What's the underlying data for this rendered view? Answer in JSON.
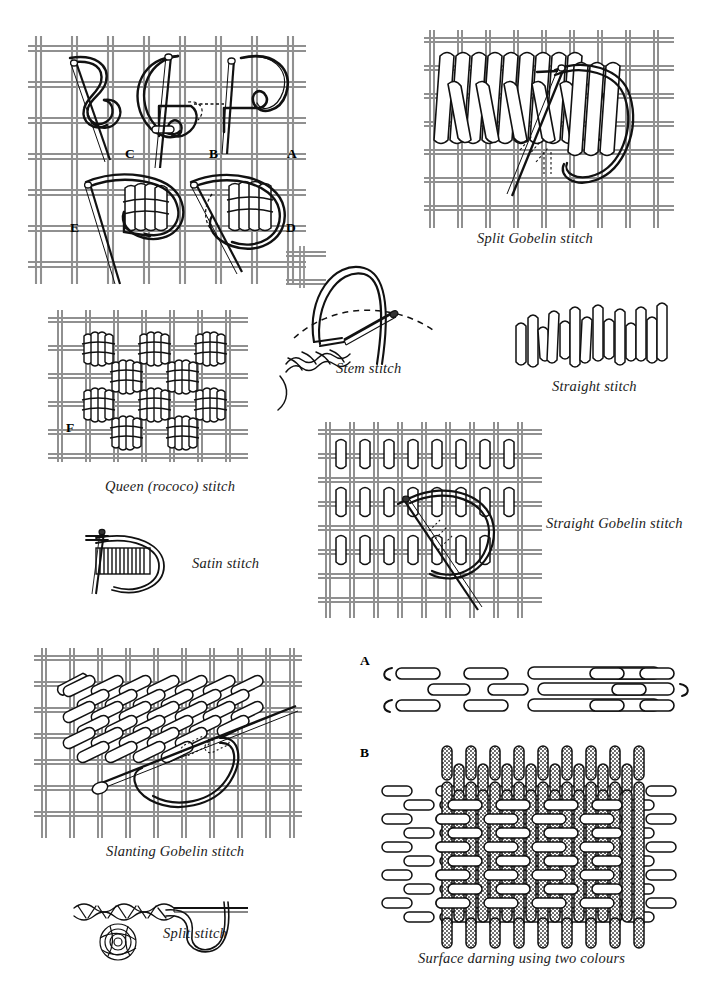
{
  "page": {
    "kind": "embroidery-stitch-diagram-plate",
    "background": "#ffffff",
    "ink": "#1a1a1a",
    "canvas_thread_color": "#8f8f8f",
    "second_colour_fill": "#b9b9b9"
  },
  "figures": [
    {
      "id": "rococo-steps",
      "caption": "",
      "step_labels": [
        "A",
        "B",
        "C",
        "D",
        "E"
      ]
    },
    {
      "id": "split-gobelin",
      "caption": "Split Gobelin stitch"
    },
    {
      "id": "stem",
      "caption": "Stem stitch"
    },
    {
      "id": "straight",
      "caption": "Straight stitch"
    },
    {
      "id": "queen-rococo",
      "caption": "Queen (rococo) stitch",
      "step_labels": [
        "F"
      ]
    },
    {
      "id": "satin",
      "caption": "Satin stitch"
    },
    {
      "id": "straight-gobelin",
      "caption": "Straight Gobelin stitch"
    },
    {
      "id": "slanting-gobelin",
      "caption": "Slanting Gobelin stitch"
    },
    {
      "id": "split",
      "caption": "Split stitch"
    },
    {
      "id": "surface-darning",
      "caption": "Surface darning using two colours",
      "step_labels": [
        "A",
        "B"
      ]
    }
  ],
  "captions": {
    "split_gobelin": "Split Gobelin stitch",
    "stem": "Stem stitch",
    "straight": "Straight stitch",
    "queen_rococo": "Queen (rococo) stitch",
    "satin": "Satin stitch",
    "straight_gobelin": "Straight Gobelin stitch",
    "slanting_gobelin": "Slanting Gobelin stitch",
    "split": "Split stitch",
    "surface_darning": "Surface darning using two colours"
  },
  "labels": {
    "a": "A",
    "b": "B",
    "c": "C",
    "d": "D",
    "e": "E",
    "f": "F",
    "darning_a": "A",
    "darning_b": "B"
  }
}
